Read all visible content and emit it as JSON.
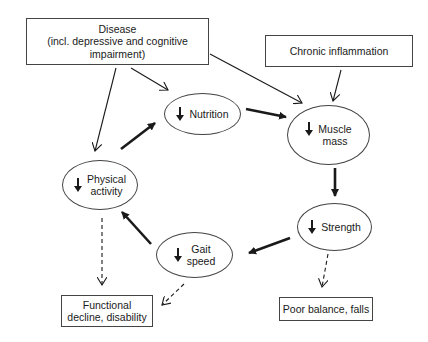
{
  "diagram": {
    "boxes": {
      "disease": {
        "line1": "Disease",
        "line2": "(incl. depressive and cognitive",
        "line3": "impairment)"
      },
      "chronic_inflammation": {
        "label": "Chronic inflammation"
      },
      "functional_decline": {
        "line1": "Functional",
        "line2": "decline, disability"
      },
      "poor_balance": {
        "label": "Poor balance, falls"
      }
    },
    "cycle_nodes": {
      "nutrition": {
        "label": "Nutrition",
        "indicator": "decrease-arrow"
      },
      "muscle_mass": {
        "line1": "Muscle",
        "line2": "mass",
        "indicator": "decrease-arrow"
      },
      "strength": {
        "label": "Strength",
        "indicator": "decrease-arrow"
      },
      "gait_speed": {
        "line1": "Gait",
        "line2": "speed",
        "indicator": "decrease-arrow"
      },
      "physical_activity": {
        "line1": "Physical",
        "line2": "activity",
        "indicator": "decrease-arrow"
      }
    },
    "edges": [
      {
        "from": "Disease",
        "to": "Nutrition",
        "style": "thin"
      },
      {
        "from": "Disease",
        "to": "Muscle mass",
        "style": "thin"
      },
      {
        "from": "Disease",
        "to": "Physical activity",
        "style": "thin"
      },
      {
        "from": "Chronic inflammation",
        "to": "Muscle mass",
        "style": "thin"
      },
      {
        "from": "Nutrition",
        "to": "Muscle mass",
        "style": "thick"
      },
      {
        "from": "Muscle mass",
        "to": "Strength",
        "style": "thick"
      },
      {
        "from": "Strength",
        "to": "Gait speed",
        "style": "thick"
      },
      {
        "from": "Gait speed",
        "to": "Physical activity",
        "style": "thick"
      },
      {
        "from": "Physical activity",
        "to": "Nutrition",
        "style": "thick"
      },
      {
        "from": "Physical activity",
        "to": "Functional decline, disability",
        "style": "dashed"
      },
      {
        "from": "Gait speed",
        "to": "Functional decline, disability",
        "style": "dashed"
      },
      {
        "from": "Strength",
        "to": "Poor balance, falls",
        "style": "dashed"
      }
    ],
    "colors": {
      "line": "#1a1a1a",
      "border": "#444444",
      "background": "#ffffff"
    }
  }
}
